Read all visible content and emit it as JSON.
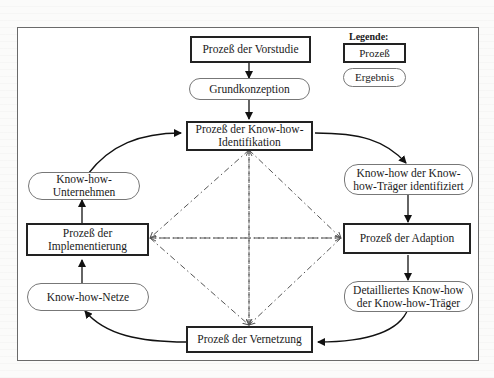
{
  "legend": {
    "title": "Legende:",
    "process_label": "Prozeß",
    "result_label": "Ergebnis"
  },
  "nodes": {
    "vorstudie": "Prozeß der Vorstudie",
    "grundkonzeption": "Grundkonzeption",
    "identifikation_1": "Prozeß der Know-how-",
    "identifikation_2": "Identifikation",
    "traeger_identifiziert_1": "Know-how der Know-",
    "traeger_identifiziert_2": "how-Träger identifiziert",
    "adaption": "Prozeß der Adaption",
    "detailliert_1": "Detailliertes Know-how",
    "detailliert_2": "der Know-how-Träger",
    "vernetzung": "Prozeß der Vernetzung",
    "netze": "Know-how-Netze",
    "implementierung_1": "Prozeß der",
    "implementierung_2": "Implementierung",
    "unternehmen": "Know-how-Unternehmen"
  },
  "colors": {
    "process_border": "#222222",
    "result_border": "#777777",
    "frame_border": "#6a6a6a",
    "dashdot": "#555555"
  }
}
